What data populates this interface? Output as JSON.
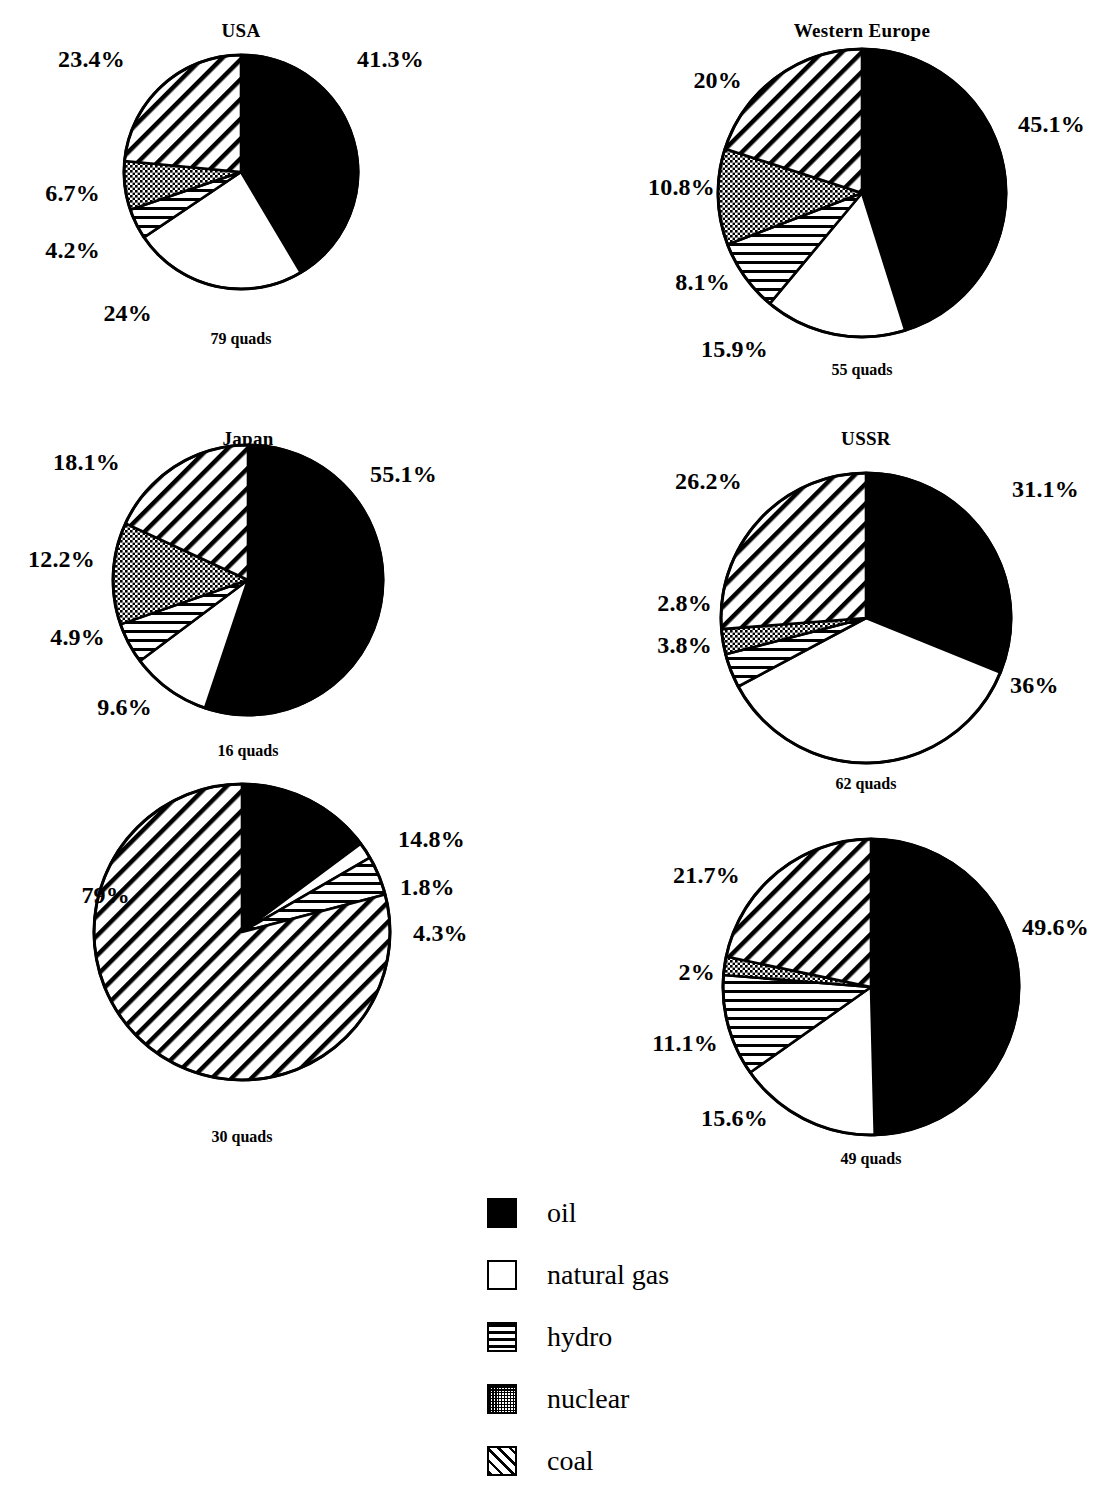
{
  "chart_data": {
    "type": "pie",
    "title": "",
    "unit": "quads",
    "legend": {
      "position": "bottom-center",
      "entries": [
        {
          "key": "oil",
          "label": "oil",
          "pattern": "solid-black"
        },
        {
          "key": "natural_gas",
          "label": "natural gas",
          "pattern": "white-empty"
        },
        {
          "key": "hydro",
          "label": "hydro",
          "pattern": "horizontal-lines"
        },
        {
          "key": "nuclear",
          "label": "nuclear",
          "pattern": "dotted-stipple"
        },
        {
          "key": "coal",
          "label": "coal",
          "pattern": "diagonal-hatch"
        }
      ]
    },
    "categories": [
      "oil",
      "natural gas",
      "hydro",
      "nuclear",
      "coal"
    ],
    "panels": [
      {
        "id": "usa",
        "title": "USA",
        "total_label": "79 quads",
        "total_value": 79,
        "slices": [
          {
            "name": "oil",
            "value": 41.3,
            "label": "41.3%"
          },
          {
            "name": "natural gas",
            "value": 24.0,
            "label": "24%"
          },
          {
            "name": "hydro",
            "value": 4.2,
            "label": "4.2%"
          },
          {
            "name": "nuclear",
            "value": 6.7,
            "label": "6.7%"
          },
          {
            "name": "coal",
            "value": 23.4,
            "label": "23.4%"
          }
        ]
      },
      {
        "id": "western_europe",
        "title": "Western Europe",
        "total_label": "55 quads",
        "total_value": 55,
        "slices": [
          {
            "name": "oil",
            "value": 45.1,
            "label": "45.1%"
          },
          {
            "name": "natural gas",
            "value": 15.9,
            "label": "15.9%"
          },
          {
            "name": "hydro",
            "value": 8.1,
            "label": "8.1%"
          },
          {
            "name": "nuclear",
            "value": 10.8,
            "label": "10.8%"
          },
          {
            "name": "coal",
            "value": 20.0,
            "label": "20%"
          }
        ]
      },
      {
        "id": "japan",
        "title": "Japan",
        "total_label": "16 quads",
        "total_value": 16,
        "slices": [
          {
            "name": "oil",
            "value": 55.1,
            "label": "55.1%"
          },
          {
            "name": "natural gas",
            "value": 9.6,
            "label": "9.6%"
          },
          {
            "name": "hydro",
            "value": 4.9,
            "label": "4.9%"
          },
          {
            "name": "nuclear",
            "value": 12.2,
            "label": "12.2%"
          },
          {
            "name": "coal",
            "value": 18.1,
            "label": "18.1%"
          }
        ]
      },
      {
        "id": "ussr",
        "title": "USSR",
        "total_label": "62 quads",
        "total_value": 62,
        "slices": [
          {
            "name": "oil",
            "value": 31.1,
            "label": "31.1%"
          },
          {
            "name": "natural gas",
            "value": 36.0,
            "label": "36%"
          },
          {
            "name": "hydro",
            "value": 3.8,
            "label": "3.8%"
          },
          {
            "name": "nuclear",
            "value": 2.8,
            "label": "2.8%"
          },
          {
            "name": "coal",
            "value": 26.2,
            "label": "26.2%"
          }
        ]
      },
      {
        "id": "china",
        "title": "China",
        "total_label": "30 quads",
        "total_value": 30,
        "slices": [
          {
            "name": "oil",
            "value": 14.8,
            "label": "14.8%"
          },
          {
            "name": "natural gas",
            "value": 1.8,
            "label": "1.8%"
          },
          {
            "name": "hydro",
            "value": 4.3,
            "label": "4.3%"
          },
          {
            "name": "nuclear",
            "value": 0.0,
            "label": ""
          },
          {
            "name": "coal",
            "value": 79.0,
            "label": "79%"
          }
        ]
      },
      {
        "id": "ldcs",
        "title": "LDCs",
        "total_label": "49 quads",
        "total_value": 49,
        "slices": [
          {
            "name": "oil",
            "value": 49.6,
            "label": "49.6%"
          },
          {
            "name": "natural gas",
            "value": 15.6,
            "label": "15.6%"
          },
          {
            "name": "hydro",
            "value": 11.1,
            "label": "11.1%"
          },
          {
            "name": "nuclear",
            "value": 2.0,
            "label": "2%"
          },
          {
            "name": "coal",
            "value": 21.7,
            "label": "21.7%"
          }
        ]
      }
    ]
  },
  "layout": {
    "panels": [
      {
        "id": "usa",
        "cx": 241,
        "cy": 172,
        "r": 117,
        "title_y": 20,
        "total_y": 330,
        "labels": [
          {
            "for": "oil",
            "x": 357,
            "y": 62,
            "anchor": "start"
          },
          {
            "for": "coal",
            "x": 125,
            "y": 62,
            "anchor": "end"
          },
          {
            "for": "nuclear",
            "x": 100,
            "y": 196,
            "anchor": "end"
          },
          {
            "for": "hydro",
            "x": 100,
            "y": 253,
            "anchor": "end"
          },
          {
            "for": "natural gas",
            "x": 152,
            "y": 316,
            "anchor": "end"
          }
        ]
      },
      {
        "id": "western_europe",
        "cx": 862,
        "cy": 193,
        "r": 144,
        "title_y": 20,
        "total_y": 361,
        "labels": [
          {
            "for": "oil",
            "x": 1018,
            "y": 127,
            "anchor": "start"
          },
          {
            "for": "coal",
            "x": 742,
            "y": 83,
            "anchor": "end"
          },
          {
            "for": "nuclear",
            "x": 715,
            "y": 190,
            "anchor": "end"
          },
          {
            "for": "hydro",
            "x": 730,
            "y": 285,
            "anchor": "end"
          },
          {
            "for": "natural gas",
            "x": 768,
            "y": 352,
            "anchor": "end"
          }
        ]
      },
      {
        "id": "japan",
        "cx": 248,
        "cy": 580,
        "r": 135,
        "title_y": 428,
        "total_y": 742,
        "labels": [
          {
            "for": "oil",
            "x": 370,
            "y": 477,
            "anchor": "start"
          },
          {
            "for": "coal",
            "x": 120,
            "y": 465,
            "anchor": "end"
          },
          {
            "for": "nuclear",
            "x": 95,
            "y": 562,
            "anchor": "end"
          },
          {
            "for": "hydro",
            "x": 105,
            "y": 640,
            "anchor": "end"
          },
          {
            "for": "natural gas",
            "x": 152,
            "y": 710,
            "anchor": "end"
          }
        ]
      },
      {
        "id": "ussr",
        "cx": 866,
        "cy": 618,
        "r": 145,
        "title_y": 428,
        "total_y": 775,
        "labels": [
          {
            "for": "oil",
            "x": 1012,
            "y": 492,
            "anchor": "start"
          },
          {
            "for": "coal",
            "x": 742,
            "y": 484,
            "anchor": "end"
          },
          {
            "for": "nuclear",
            "x": 712,
            "y": 606,
            "anchor": "end"
          },
          {
            "for": "hydro",
            "x": 712,
            "y": 648,
            "anchor": "end"
          },
          {
            "for": "natural gas",
            "x": 1010,
            "y": 688,
            "anchor": "start"
          }
        ]
      },
      {
        "id": "china",
        "cx": 242,
        "cy": 932,
        "r": 148,
        "title_y": 822,
        "total_y": 1128,
        "labels": [
          {
            "for": "oil",
            "x": 398,
            "y": 842,
            "anchor": "start"
          },
          {
            "for": "natural gas",
            "x": 400,
            "y": 890,
            "anchor": "start"
          },
          {
            "for": "hydro",
            "x": 413,
            "y": 936,
            "anchor": "start"
          },
          {
            "for": "coal",
            "x": 130,
            "y": 898,
            "anchor": "end"
          }
        ]
      },
      {
        "id": "ldcs",
        "cx": 871,
        "cy": 987,
        "r": 148,
        "title_y": 840,
        "total_y": 1150,
        "labels": [
          {
            "for": "oil",
            "x": 1022,
            "y": 930,
            "anchor": "start"
          },
          {
            "for": "coal",
            "x": 740,
            "y": 878,
            "anchor": "end"
          },
          {
            "for": "nuclear",
            "x": 715,
            "y": 975,
            "anchor": "end"
          },
          {
            "for": "hydro",
            "x": 718,
            "y": 1046,
            "anchor": "end"
          },
          {
            "for": "natural gas",
            "x": 768,
            "y": 1121,
            "anchor": "end"
          }
        ]
      }
    ]
  }
}
